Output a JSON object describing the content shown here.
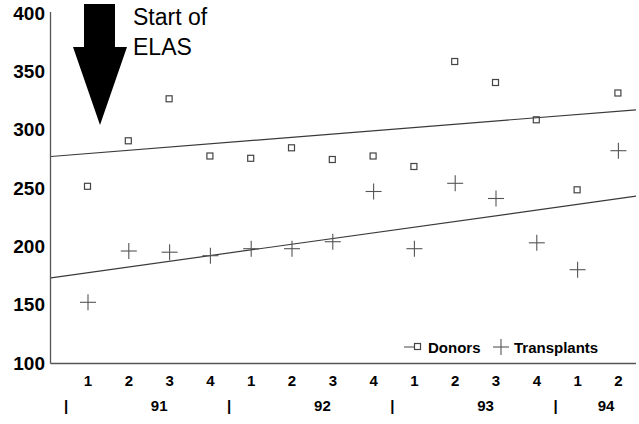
{
  "chart_data": {
    "type": "scatter",
    "title": "",
    "xlabel": "",
    "ylabel": "",
    "ylim": [
      100,
      400
    ],
    "yticks": [
      100,
      150,
      200,
      250,
      300,
      350,
      400
    ],
    "grid": false,
    "legend_position": "bottom-right",
    "categories": [
      "1",
      "2",
      "3",
      "4",
      "1",
      "2",
      "3",
      "4",
      "1",
      "2",
      "3",
      "4",
      "1",
      "2"
    ],
    "year_groups": [
      {
        "label": "91",
        "quarters": [
          "1",
          "2",
          "3",
          "4"
        ]
      },
      {
        "label": "92",
        "quarters": [
          "1",
          "2",
          "3",
          "4"
        ]
      },
      {
        "label": "93",
        "quarters": [
          "1",
          "2",
          "3",
          "4"
        ]
      },
      {
        "label": "94",
        "quarters": [
          "1",
          "2"
        ]
      }
    ],
    "series": [
      {
        "name": "Donors",
        "marker": "square",
        "values": [
          251,
          290,
          326,
          277,
          275,
          284,
          274,
          277,
          268,
          358,
          340,
          308,
          248,
          331
        ],
        "trend": {
          "start": 277,
          "end": 317
        }
      },
      {
        "name": "Transplants",
        "marker": "plus",
        "values": [
          152,
          196,
          195,
          192,
          198,
          198,
          204,
          247,
          198,
          254,
          241,
          203,
          180,
          282
        ],
        "trend": {
          "start": 173,
          "end": 243
        }
      }
    ],
    "annotations": [
      {
        "name": "start-of-elas",
        "line1": "Start of",
        "line2": "ELAS",
        "marker": "down-arrow"
      }
    ]
  },
  "legend": {
    "entries": [
      {
        "label": "Donors",
        "marker": "square"
      },
      {
        "label": "Transplants",
        "marker": "plus"
      }
    ]
  },
  "axes": {
    "y_labels": [
      "400",
      "350",
      "300",
      "250",
      "200",
      "150",
      "100"
    ],
    "x_labels": [
      "1",
      "2",
      "3",
      "4",
      "1",
      "2",
      "3",
      "4",
      "1",
      "2",
      "3",
      "4",
      "1",
      "2"
    ],
    "year_labels": [
      "91",
      "92",
      "93",
      "94"
    ],
    "separator_glyph": "|"
  },
  "colors": {
    "axis": "#555555",
    "trend": "#3a3a3a",
    "marker": "#444444",
    "text": "#000000",
    "background": "#ffffff"
  }
}
